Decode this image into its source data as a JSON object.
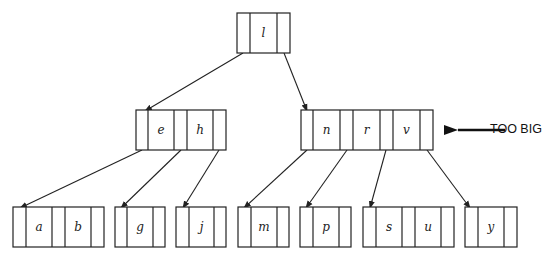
{
  "diagram": {
    "type": "b-tree",
    "annotation": {
      "text": "TOO BIG",
      "target": "right-internal-node"
    },
    "nodes": {
      "root": {
        "keys": [
          "l"
        ]
      },
      "left_internal": {
        "keys": [
          "e",
          "h"
        ]
      },
      "right_internal": {
        "keys": [
          "n",
          "r",
          "v"
        ],
        "status": "TOO BIG"
      },
      "leaves": [
        {
          "keys": [
            "a",
            "b"
          ]
        },
        {
          "keys": [
            "g"
          ]
        },
        {
          "keys": [
            "j"
          ]
        },
        {
          "keys": [
            "m"
          ]
        },
        {
          "keys": [
            "p"
          ]
        },
        {
          "keys": [
            "s",
            "u"
          ]
        },
        {
          "keys": [
            "y"
          ]
        }
      ]
    },
    "colors": {
      "line": "#222222",
      "background": "#ffffff"
    }
  }
}
